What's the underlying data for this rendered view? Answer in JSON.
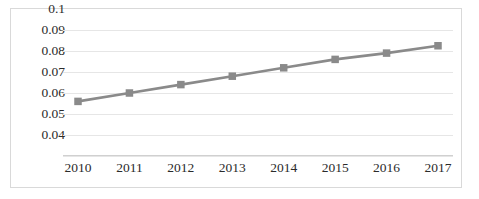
{
  "chart_data": {
    "type": "line",
    "title": "",
    "xlabel": "",
    "ylabel": "",
    "categories": [
      "2010",
      "2011",
      "2012",
      "2013",
      "2014",
      "2015",
      "2016",
      "2017"
    ],
    "values": [
      0.066,
      0.07,
      0.074,
      0.078,
      0.082,
      0.086,
      0.089,
      0.0925
    ],
    "series": [
      {
        "name": "",
        "values": [
          0.066,
          0.07,
          0.074,
          0.078,
          0.082,
          0.086,
          0.089,
          0.0925
        ]
      }
    ],
    "ylim": [
      0.04,
      0.1
    ],
    "xlim": [
      2010,
      2017
    ],
    "ytick_labels": [
      "0.1",
      "0.09",
      "0.08",
      "0.07",
      "0.06",
      "0.05",
      "0.04"
    ],
    "ytick_values": [
      0.1,
      0.09,
      0.08,
      0.07,
      0.06,
      0.05,
      0.04
    ],
    "xtick_labels": [
      "2010",
      "2011",
      "2012",
      "2013",
      "2014",
      "2015",
      "2016",
      "2017"
    ],
    "grid": true,
    "grid_axis": "y",
    "legend": false,
    "legend_position": "none",
    "marker": "square",
    "line_color": "#8a8a8a",
    "marker_color": "#8a8a8a",
    "grid_color": "#e6e6e6",
    "border_color": "#d9d9d9",
    "background_color": "#ffffff",
    "text_color": "#2b2b2b"
  }
}
